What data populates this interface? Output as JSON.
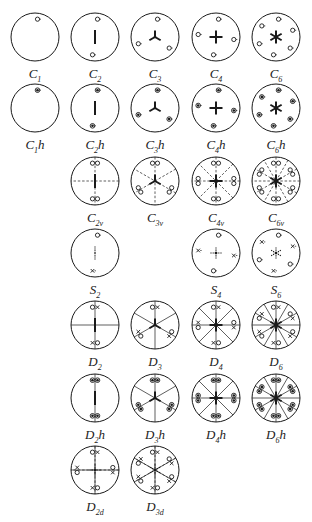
{
  "figure": {
    "type": "stereographic projections of crystallographic point groups",
    "columns_center_x": [
      35,
      95,
      155,
      216,
      276
    ],
    "rows_center_y": [
      37,
      108,
      181,
      253,
      325,
      398,
      470
    ],
    "groups": [
      {
        "id": "C1",
        "main": "C",
        "sub": "1",
        "suffix": "",
        "row": 0,
        "col": 0,
        "axis": "none",
        "mirrors": 0,
        "dashed_mirrors": 0,
        "marks": 1,
        "kind": "open"
      },
      {
        "id": "C2",
        "main": "C",
        "sub": "2",
        "suffix": "",
        "row": 0,
        "col": 1,
        "axis": "2",
        "mirrors": 0,
        "dashed_mirrors": 0,
        "marks": 2,
        "kind": "open"
      },
      {
        "id": "C3",
        "main": "C",
        "sub": "3",
        "suffix": "",
        "row": 0,
        "col": 2,
        "axis": "3",
        "mirrors": 0,
        "dashed_mirrors": 0,
        "marks": 3,
        "kind": "open"
      },
      {
        "id": "C4",
        "main": "C",
        "sub": "4",
        "suffix": "",
        "row": 0,
        "col": 3,
        "axis": "4",
        "mirrors": 0,
        "dashed_mirrors": 0,
        "marks": 4,
        "kind": "open"
      },
      {
        "id": "C6",
        "main": "C",
        "sub": "6",
        "suffix": "",
        "row": 0,
        "col": 4,
        "axis": "6",
        "mirrors": 0,
        "dashed_mirrors": 0,
        "marks": 6,
        "kind": "open"
      },
      {
        "id": "C1h",
        "main": "C",
        "sub": "1",
        "suffix": "h",
        "row": 1,
        "col": 0,
        "axis": "none",
        "mirrors": 0,
        "dashed_mirrors": 0,
        "marks": 1,
        "kind": "filled"
      },
      {
        "id": "C2h",
        "main": "C",
        "sub": "2",
        "suffix": "h",
        "row": 1,
        "col": 1,
        "axis": "2",
        "mirrors": 0,
        "dashed_mirrors": 0,
        "marks": 2,
        "kind": "filled"
      },
      {
        "id": "C3h",
        "main": "C",
        "sub": "3",
        "suffix": "h",
        "row": 1,
        "col": 2,
        "axis": "3",
        "mirrors": 0,
        "dashed_mirrors": 0,
        "marks": 3,
        "kind": "filled"
      },
      {
        "id": "C4h",
        "main": "C",
        "sub": "4",
        "suffix": "h",
        "row": 1,
        "col": 3,
        "axis": "4",
        "mirrors": 0,
        "dashed_mirrors": 0,
        "marks": 4,
        "kind": "filled"
      },
      {
        "id": "C6h",
        "main": "C",
        "sub": "6",
        "suffix": "h",
        "row": 1,
        "col": 4,
        "axis": "6",
        "mirrors": 0,
        "dashed_mirrors": 0,
        "marks": 6,
        "kind": "filled"
      },
      {
        "id": "C2v",
        "main": "C",
        "sub": "2v",
        "suffix": "",
        "row": 2,
        "col": 1,
        "axis": "2",
        "mirrors": 0,
        "dashed_mirrors": 2,
        "marks": 2,
        "kind": "pair-open"
      },
      {
        "id": "C3v",
        "main": "C",
        "sub": "3v",
        "suffix": "",
        "row": 2,
        "col": 2,
        "axis": "3",
        "mirrors": 0,
        "dashed_mirrors": 3,
        "marks": 3,
        "kind": "pair-open"
      },
      {
        "id": "C4v",
        "main": "C",
        "sub": "4v",
        "suffix": "",
        "row": 2,
        "col": 3,
        "axis": "4",
        "mirrors": 0,
        "dashed_mirrors": 4,
        "marks": 4,
        "kind": "pair-open"
      },
      {
        "id": "C6v",
        "main": "C",
        "sub": "6v",
        "suffix": "",
        "row": 2,
        "col": 4,
        "axis": "6",
        "mirrors": 0,
        "dashed_mirrors": 6,
        "marks": 6,
        "kind": "pair-open"
      },
      {
        "id": "S2",
        "main": "S",
        "sub": "2",
        "suffix": "",
        "row": 3,
        "col": 1,
        "axis": "s2",
        "mirrors": 0,
        "dashed_mirrors": 0,
        "marks": 2,
        "kind": "alt"
      },
      {
        "id": "S4",
        "main": "S",
        "sub": "4",
        "suffix": "",
        "row": 3,
        "col": 3,
        "axis": "s4",
        "mirrors": 0,
        "dashed_mirrors": 0,
        "marks": 4,
        "kind": "alt"
      },
      {
        "id": "S6",
        "main": "S",
        "sub": "6",
        "suffix": "",
        "row": 3,
        "col": 4,
        "axis": "s6",
        "mirrors": 0,
        "dashed_mirrors": 0,
        "marks": 6,
        "kind": "alt"
      },
      {
        "id": "D2",
        "main": "D",
        "sub": "2",
        "suffix": "",
        "row": 4,
        "col": 1,
        "axis": "2",
        "mirrors": 2,
        "dashed_mirrors": 0,
        "marks": 2,
        "kind": "pair-mixed"
      },
      {
        "id": "D3",
        "main": "D",
        "sub": "3",
        "suffix": "",
        "row": 4,
        "col": 2,
        "axis": "3",
        "mirrors": 3,
        "dashed_mirrors": 0,
        "marks": 3,
        "kind": "pair-mixed"
      },
      {
        "id": "D4",
        "main": "D",
        "sub": "4",
        "suffix": "",
        "row": 4,
        "col": 3,
        "axis": "4",
        "mirrors": 4,
        "dashed_mirrors": 0,
        "marks": 4,
        "kind": "pair-mixed"
      },
      {
        "id": "D6",
        "main": "D",
        "sub": "6",
        "suffix": "",
        "row": 4,
        "col": 4,
        "axis": "6",
        "mirrors": 6,
        "dashed_mirrors": 0,
        "marks": 6,
        "kind": "pair-mixed"
      },
      {
        "id": "D2h",
        "main": "D",
        "sub": "2",
        "suffix": "h",
        "row": 5,
        "col": 1,
        "axis": "2",
        "mirrors": 1,
        "dashed_mirrors": 0,
        "marks": 2,
        "kind": "pair-filled"
      },
      {
        "id": "D3h",
        "main": "D",
        "sub": "3",
        "suffix": "h",
        "row": 5,
        "col": 2,
        "axis": "3",
        "mirrors": 3,
        "dashed_mirrors": 0,
        "marks": 3,
        "kind": "pair-filled"
      },
      {
        "id": "D4h",
        "main": "D",
        "sub": "4",
        "suffix": "h",
        "row": 5,
        "col": 3,
        "axis": "4",
        "mirrors": 4,
        "dashed_mirrors": 0,
        "marks": 4,
        "kind": "pair-filled"
      },
      {
        "id": "D6h",
        "main": "D",
        "sub": "6",
        "suffix": "h",
        "row": 5,
        "col": 4,
        "axis": "6",
        "mirrors": 6,
        "dashed_mirrors": 0,
        "marks": 6,
        "kind": "pair-filled"
      },
      {
        "id": "D2d",
        "main": "D",
        "sub": "2d",
        "suffix": "",
        "row": 6,
        "col": 1,
        "axis": "s4",
        "mirrors": 2,
        "dashed_mirrors": 2,
        "marks": 4,
        "kind": "pair-mixed"
      },
      {
        "id": "D3d",
        "main": "D",
        "sub": "3d",
        "suffix": "",
        "row": 6,
        "col": 2,
        "axis": "s6",
        "mirrors": 3,
        "dashed_mirrors": 3,
        "marks": 6,
        "kind": "pair-mixed"
      }
    ]
  }
}
